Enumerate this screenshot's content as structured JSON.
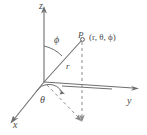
{
  "figure": {
    "kind": "spherical-coordinates-diagram",
    "background_color": "#ffffff",
    "line_color": "#6e6e6e",
    "dash_color": "#8a8a8a",
    "text_color": "#4a4a4a",
    "axes": [
      {
        "name": "z-axis",
        "label": "z",
        "direction": "up"
      },
      {
        "name": "y-axis",
        "label": "y",
        "direction": "right"
      },
      {
        "name": "x-axis",
        "label": "x",
        "direction": "down-left"
      }
    ],
    "angles": [
      {
        "name": "phi-angle",
        "label": "ϕ",
        "between": "z-axis and radius"
      },
      {
        "name": "theta-angle",
        "label": "θ",
        "between": "x-axis and projection"
      }
    ],
    "radius": {
      "name": "radius-segment",
      "label": "r"
    },
    "point": {
      "name": "point-P",
      "marker_label": "P",
      "coordinates_label": "(r, θ, ϕ)"
    }
  }
}
